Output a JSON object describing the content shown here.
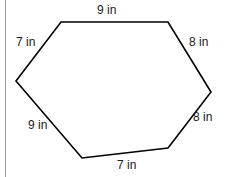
{
  "figure": {
    "type": "hexagon-diagram",
    "stroke_color": "#000000",
    "fill_color": "#ffffff",
    "stroke_width": 1.6,
    "canvas": {
      "width": 228,
      "height": 177
    },
    "rule_color": "#9a9a9a",
    "vertices": [
      {
        "name": "top-left",
        "x": 61,
        "y": 22
      },
      {
        "name": "top-right",
        "x": 168,
        "y": 22
      },
      {
        "name": "right",
        "x": 211,
        "y": 92
      },
      {
        "name": "bottom-right",
        "x": 168,
        "y": 148
      },
      {
        "name": "bottom-left",
        "x": 82,
        "y": 158
      },
      {
        "name": "left",
        "x": 16,
        "y": 81
      }
    ],
    "labels": {
      "top": "9 in",
      "upper_left": "7 in",
      "upper_right": "8 in",
      "lower_right": "8 in",
      "lower_left": "9 in",
      "bottom": "7 in"
    },
    "unit": "in",
    "side_lengths": [
      9,
      8,
      8,
      7,
      9,
      7
    ]
  }
}
